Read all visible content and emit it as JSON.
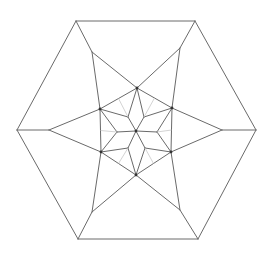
{
  "diagram": {
    "title": "",
    "colors": {
      "edge": "#6a6a6a",
      "faint": "#c8c8c8",
      "node": "#333333",
      "background": "#ffffff"
    },
    "outer_hexagon": [
      [
        76,
        21
      ],
      [
        195,
        21
      ],
      [
        256,
        130
      ],
      [
        198,
        239
      ],
      [
        78,
        239
      ],
      [
        17,
        130
      ]
    ],
    "star_tips": [
      [
        92,
        52
      ],
      [
        180,
        48
      ],
      [
        222,
        130
      ],
      [
        180,
        210
      ],
      [
        92,
        212
      ],
      [
        49,
        130
      ]
    ],
    "inner_hexagon": [
      [
        137,
        88
      ],
      [
        172,
        108
      ],
      [
        171,
        152
      ],
      [
        136,
        175
      ],
      [
        101,
        152
      ],
      [
        100,
        109
      ]
    ],
    "center": [
      136,
      131
    ],
    "rosette_points": [
      [
        128,
        117
      ],
      [
        144,
        117
      ],
      [
        157,
        132
      ],
      [
        145,
        148
      ],
      [
        128,
        148
      ],
      [
        117,
        132
      ]
    ]
  }
}
